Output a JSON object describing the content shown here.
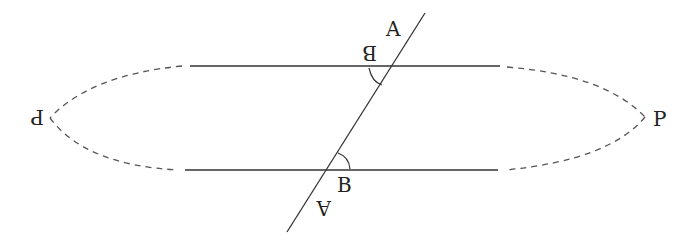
{
  "diagram": {
    "labels": {
      "top_A": "A",
      "top_B": "B",
      "bottom_A": "A",
      "bottom_B": "B",
      "left_P": "P",
      "right_P": "P"
    },
    "colors": {
      "line": "#333333",
      "dashed": "#555555",
      "background": "#ffffff"
    }
  }
}
